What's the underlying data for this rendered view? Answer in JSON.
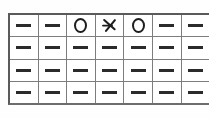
{
  "canvas": {
    "width": 209,
    "height": 118,
    "background_color": "#ffffff"
  },
  "grid": {
    "name": "glyph-grid",
    "columns": 7,
    "rows": 4,
    "cropped_right_edge": true,
    "border_color": "#5a5a5a",
    "line_color": "#7d7d7d",
    "glyph_color": "#2b2b2b",
    "cells": [
      [
        {
          "glyph": "dash-glyph",
          "text": "—"
        },
        {
          "glyph": "dash-glyph",
          "text": "—"
        },
        {
          "glyph": "circle-glyph",
          "text": "O"
        },
        {
          "glyph": "arrow-glyph",
          "text": "⤴"
        },
        {
          "glyph": "circle-glyph",
          "text": "O"
        },
        {
          "glyph": "dash-glyph",
          "text": "—"
        },
        {
          "glyph": "dash-glyph",
          "text": "—"
        }
      ],
      [
        {
          "glyph": "dash-glyph",
          "text": "—"
        },
        {
          "glyph": "dash-glyph",
          "text": "—"
        },
        {
          "glyph": "dash-glyph",
          "text": "—"
        },
        {
          "glyph": "dash-glyph",
          "text": "—"
        },
        {
          "glyph": "dash-glyph",
          "text": "—"
        },
        {
          "glyph": "dash-glyph",
          "text": "—"
        },
        {
          "glyph": "dash-glyph",
          "text": "—"
        }
      ],
      [
        {
          "glyph": "dash-glyph",
          "text": "—"
        },
        {
          "glyph": "dash-glyph",
          "text": "—"
        },
        {
          "glyph": "dash-glyph",
          "text": "—"
        },
        {
          "glyph": "dash-glyph",
          "text": "—"
        },
        {
          "glyph": "dash-glyph",
          "text": "—"
        },
        {
          "glyph": "dash-glyph",
          "text": "—"
        },
        {
          "glyph": "dash-glyph",
          "text": "—"
        }
      ],
      [
        {
          "glyph": "dash-glyph",
          "text": "—"
        },
        {
          "glyph": "dash-glyph",
          "text": "—"
        },
        {
          "glyph": "dash-glyph",
          "text": "—"
        },
        {
          "glyph": "dash-glyph",
          "text": "—"
        },
        {
          "glyph": "dash-glyph",
          "text": "—"
        },
        {
          "glyph": "dash-glyph",
          "text": "—"
        },
        {
          "glyph": "dash-glyph",
          "text": "—"
        }
      ]
    ]
  }
}
